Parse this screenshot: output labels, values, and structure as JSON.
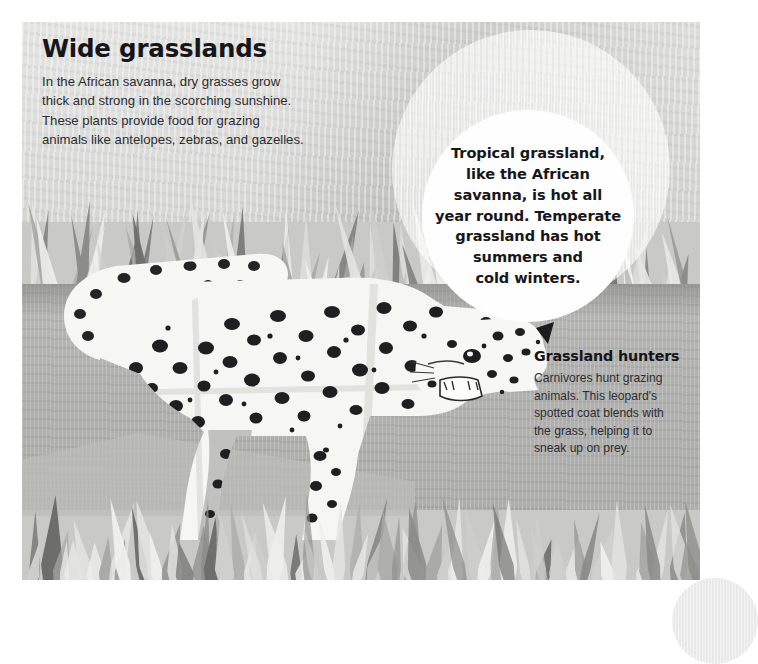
{
  "page": {
    "background_color": "#ffffff",
    "artwork_bounds": {
      "x": 22,
      "y": 22,
      "width": 678,
      "height": 558
    }
  },
  "heading": {
    "title": "Wide grasslands",
    "body": "In the African savanna, dry grasses grow\nthick and strong in the scorching sunshine.\nThese plants provide food for grazing\nanimals like antelopes, zebras, and gazelles."
  },
  "callout": {
    "shape": "circle",
    "text": "Tropical grassland,\nlike the African\nsavanna, is hot all\nyear round. Temperate\ngrassland has hot\nsummers and\ncold winters.",
    "background_color": "#fefefe",
    "text_color": "#17171a"
  },
  "caption": {
    "title": "Grassland hunters",
    "body": "Carnivores hunt grazing\nanimals. This leopard's\nspotted coat blends with\nthe grass, helping it to\nsneak up on prey."
  },
  "illustration": {
    "subject": "leopard-walking",
    "style": "cut-paper-collage",
    "scene_layers": [
      "sky",
      "back-grass",
      "ground",
      "leopard",
      "front-grass"
    ],
    "colors": {
      "sky": "#d6d6d4",
      "ground": "#b2b2b0",
      "grass_light": "#e4e4e2",
      "grass_mid": "#a9a9a7",
      "grass_dark": "#6d6d6b",
      "leopard_body": "#f6f6f4",
      "leopard_spots": "#1d1d1f"
    }
  }
}
